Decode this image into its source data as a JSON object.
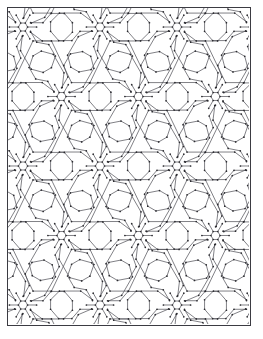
{
  "document": {
    "title": "Hexagonal Zigzag Tessellation",
    "kind": "line-art-pattern",
    "caption": ""
  },
  "canvas": {
    "width": 263,
    "height": 339,
    "background_color": "#ffffff"
  },
  "frame": {
    "name": "page-border",
    "x": 7,
    "y": 7,
    "width": 244,
    "height": 319,
    "stroke_color": "#3b3b42",
    "stroke_width": 1.6,
    "fill_color": "#ffffff"
  },
  "pattern": {
    "name": "interlocking-hexagon-chevron-tiling",
    "stroke_color": "#4a4a52",
    "stroke_width": 0.7,
    "fill_color": "none",
    "vertex_dot_color": "#2b2b30",
    "vertex_dot_radius": 0.85,
    "lattice": {
      "type": "staggered-hexagonal",
      "column_spacing": 77,
      "row_spacing": 69.5,
      "row_offset_x": 38.5,
      "origin_x": 15,
      "origin_y": 19
    },
    "node": {
      "name": "hub-hexagon",
      "shape": "hexagon",
      "radius": 4.6,
      "arm_count": 6,
      "arm_length": 9,
      "arm_angles_deg": [
        0,
        60,
        120,
        180,
        240,
        300
      ]
    },
    "band": {
      "name": "chevron-band",
      "half_width": 9.5,
      "segment_angle_deg": 30,
      "description": "Thick zigzag ribbons radiating from each hub hexagon and interlocking with neighbouring hubs"
    }
  },
  "legend": {
    "items": []
  }
}
